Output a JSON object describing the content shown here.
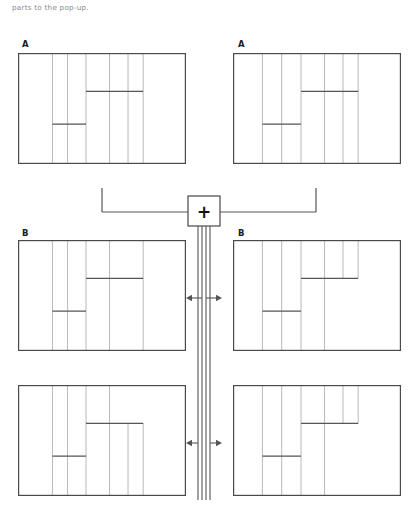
{
  "page": {
    "width": 418,
    "height": 515,
    "background": "#ffffff",
    "caption_text": "parts to the pop-up.",
    "caption_color": "#8a8a8a",
    "line_color_outer": "#4a4a4a",
    "line_color_inner": "#b9b9b9",
    "line_color_cut": "#555555",
    "connector_color": "#555555",
    "label_color": "#1a1a1a"
  },
  "operator": {
    "name": "crossover-operator",
    "symbol": "+",
    "box": {
      "x": 188,
      "y": 196,
      "w": 32,
      "h": 30
    }
  },
  "panels": [
    {
      "id": "parent-a-left",
      "label": "A",
      "label_x": 22,
      "label_y": 39,
      "frame": {
        "x": 18,
        "y": 53,
        "w": 168,
        "h": 111
      },
      "verticals": [
        {
          "x": 0.205,
          "y0": 0.0,
          "y1": 1.0
        },
        {
          "x": 0.295,
          "y0": 0.0,
          "y1": 1.0
        },
        {
          "x": 0.405,
          "y0": 0.0,
          "y1": 1.0
        },
        {
          "x": 0.545,
          "y0": 0.0,
          "y1": 1.0
        },
        {
          "x": 0.655,
          "y0": 0.0,
          "y1": 1.0
        },
        {
          "x": 0.745,
          "y0": 0.0,
          "y1": 1.0
        }
      ],
      "cuts": [
        {
          "type": "h",
          "x0": 0.405,
          "x1": 0.745,
          "y": 0.345
        },
        {
          "type": "h",
          "x0": 0.205,
          "x1": 0.405,
          "y": 0.64
        }
      ]
    },
    {
      "id": "parent-a-right",
      "label": "A",
      "label_x": 238,
      "label_y": 39,
      "frame": {
        "x": 233,
        "y": 53,
        "w": 168,
        "h": 111
      },
      "verticals": [
        {
          "x": 0.175,
          "y0": 0.0,
          "y1": 1.0
        },
        {
          "x": 0.29,
          "y0": 0.0,
          "y1": 1.0
        },
        {
          "x": 0.405,
          "y0": 0.0,
          "y1": 1.0
        },
        {
          "x": 0.545,
          "y0": 0.0,
          "y1": 1.0
        },
        {
          "x": 0.655,
          "y0": 0.0,
          "y1": 1.0
        },
        {
          "x": 0.745,
          "y0": 0.0,
          "y1": 1.0
        }
      ],
      "cuts": [
        {
          "type": "h",
          "x0": 0.405,
          "x1": 0.745,
          "y": 0.345
        },
        {
          "type": "h",
          "x0": 0.175,
          "x1": 0.405,
          "y": 0.64
        }
      ]
    },
    {
      "id": "child-b-mid-left",
      "label": "B",
      "label_x": 22,
      "label_y": 228,
      "frame": {
        "x": 18,
        "y": 240,
        "w": 168,
        "h": 111
      },
      "verticals": [
        {
          "x": 0.205,
          "y0": 0.0,
          "y1": 1.0
        },
        {
          "x": 0.295,
          "y0": 0.0,
          "y1": 1.0
        },
        {
          "x": 0.405,
          "y0": 0.0,
          "y1": 1.0
        },
        {
          "x": 0.545,
          "y0": 0.0,
          "y1": 1.0
        },
        {
          "x": 0.745,
          "y0": 0.0,
          "y1": 1.0
        }
      ],
      "cuts": [
        {
          "type": "h",
          "x0": 0.405,
          "x1": 0.745,
          "y": 0.345
        },
        {
          "type": "h",
          "x0": 0.205,
          "x1": 0.405,
          "y": 0.64
        }
      ]
    },
    {
      "id": "child-b-mid-right",
      "label": "B",
      "label_x": 238,
      "label_y": 228,
      "frame": {
        "x": 233,
        "y": 240,
        "w": 168,
        "h": 111
      },
      "verticals": [
        {
          "x": 0.175,
          "y0": 0.0,
          "y1": 1.0
        },
        {
          "x": 0.29,
          "y0": 0.0,
          "y1": 1.0
        },
        {
          "x": 0.405,
          "y0": 0.0,
          "y1": 1.0
        },
        {
          "x": 0.545,
          "y0": 0.0,
          "y1": 1.0
        },
        {
          "x": 0.655,
          "y0": 0.0,
          "y1": 0.345
        },
        {
          "x": 0.745,
          "y0": 0.0,
          "y1": 0.345
        }
      ],
      "cuts": [
        {
          "type": "h",
          "x0": 0.405,
          "x1": 0.745,
          "y": 0.345
        },
        {
          "type": "h",
          "x0": 0.175,
          "x1": 0.405,
          "y": 0.64
        }
      ]
    },
    {
      "id": "child-b-bottom-left",
      "label": "",
      "label_x": 22,
      "label_y": 372,
      "frame": {
        "x": 18,
        "y": 385,
        "w": 168,
        "h": 111
      },
      "verticals": [
        {
          "x": 0.205,
          "y0": 0.0,
          "y1": 1.0
        },
        {
          "x": 0.295,
          "y0": 0.0,
          "y1": 1.0
        },
        {
          "x": 0.405,
          "y0": 0.0,
          "y1": 1.0
        },
        {
          "x": 0.545,
          "y0": 0.0,
          "y1": 1.0
        },
        {
          "x": 0.655,
          "y0": 0.345,
          "y1": 1.0
        },
        {
          "x": 0.745,
          "y0": 0.345,
          "y1": 1.0
        }
      ],
      "cuts": [
        {
          "type": "h",
          "x0": 0.405,
          "x1": 0.745,
          "y": 0.345
        },
        {
          "type": "h",
          "x0": 0.205,
          "x1": 0.405,
          "y": 0.64
        }
      ]
    },
    {
      "id": "child-b-bottom-right",
      "label": "",
      "label_x": 238,
      "label_y": 372,
      "frame": {
        "x": 233,
        "y": 385,
        "w": 168,
        "h": 111
      },
      "verticals": [
        {
          "x": 0.175,
          "y0": 0.0,
          "y1": 1.0
        },
        {
          "x": 0.29,
          "y0": 0.0,
          "y1": 1.0
        },
        {
          "x": 0.405,
          "y0": 0.0,
          "y1": 1.0
        },
        {
          "x": 0.545,
          "y0": 0.0,
          "y1": 1.0
        },
        {
          "x": 0.655,
          "y0": 0.0,
          "y1": 0.345
        },
        {
          "x": 0.745,
          "y0": 0.0,
          "y1": 0.345
        }
      ],
      "cuts": [
        {
          "type": "h",
          "x0": 0.405,
          "x1": 0.745,
          "y": 0.345
        },
        {
          "type": "h",
          "x0": 0.175,
          "x1": 0.405,
          "y": 0.64
        }
      ]
    }
  ],
  "connectors": {
    "parent_bus_y": 212,
    "parent_left_x": 102,
    "parent_right_x": 316,
    "parent_stub_top_y": 188,
    "down_lines_x": [
      198,
      202,
      206,
      210
    ],
    "down_lines_top_y": 226,
    "down_lines_bottom_y": 500,
    "arrow_rows": [
      {
        "y": 298,
        "left_x": 186,
        "right_x": 222
      },
      {
        "y": 443,
        "left_x": 186,
        "right_x": 222
      }
    ]
  }
}
